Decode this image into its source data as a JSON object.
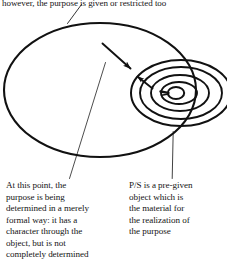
{
  "figure": {
    "type": "concept-diagram",
    "ink_color": "#111111",
    "background_color": "#ffffff",
    "shapes": {
      "outer_ellipse": {
        "cx": 100,
        "cy": 90,
        "rx": 96,
        "ry": 67
      },
      "nested_ellipses": [
        {
          "cx": 181,
          "cy": 93,
          "rx": 50,
          "ry": 33
        },
        {
          "cx": 181,
          "cy": 93,
          "rx": 41,
          "ry": 26
        },
        {
          "cx": 180,
          "cy": 93,
          "rx": 29,
          "ry": 18
        },
        {
          "cx": 179,
          "cy": 93,
          "rx": 18,
          "ry": 11
        },
        {
          "cx": 175,
          "cy": 93,
          "rx": 8,
          "ry": 6
        }
      ],
      "arrows": [
        {
          "name": "long-arrow",
          "from": [
            103,
            44
          ],
          "to": [
            133,
            71
          ]
        },
        {
          "name": "short-arrow",
          "from": [
            152,
            88
          ],
          "to": [
            134,
            74
          ]
        }
      ],
      "leader_lines": [
        {
          "name": "top-leader",
          "from": [
            81,
            5
          ],
          "to": [
            67,
            23
          ]
        },
        {
          "name": "left-leader",
          "from": [
            106,
            62
          ],
          "to": [
            69,
            179
          ]
        },
        {
          "name": "right-leader",
          "from": [
            173,
            132
          ],
          "to": [
            172,
            178
          ]
        }
      ]
    }
  },
  "annotations": {
    "top": "however, the purpose is given or restricted too",
    "left": "At this point, the\npurpose is being\ndetermined in a merely\nformal way: it has a\ncharacter through the\nobject, but is not\ncompletely determined",
    "right": "P/S is a pre-given\nobject which is\nthe material for\nthe realization of\nthe purpose"
  }
}
